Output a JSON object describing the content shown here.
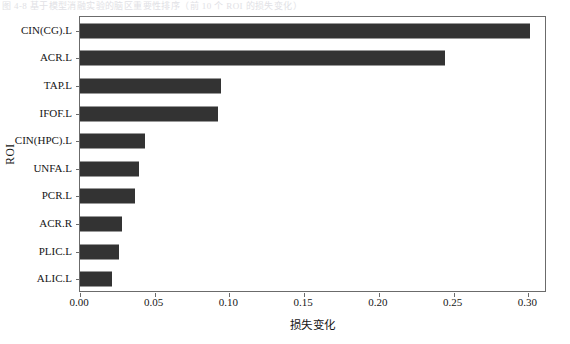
{
  "top_strip": {
    "text": "图 4-8 基于模型消融实验的脑区重要性排序（前 10 个 ROI 的损失变化）"
  },
  "chart_data": {
    "type": "bar",
    "orientation": "horizontal",
    "title": "",
    "xlabel": "损失变化",
    "ylabel": "ROI",
    "categories": [
      "CIN(CG).L",
      "ACR.L",
      "TAP.L",
      "IFOF.L",
      "CIN(HPC).L",
      "UNFA.L",
      "PCR.L",
      "ACR.R",
      "PLIC.L",
      "ALIC.L"
    ],
    "values": [
      0.301,
      0.244,
      0.0945,
      0.0925,
      0.0435,
      0.0395,
      0.0369,
      0.0281,
      0.0261,
      0.0214
    ],
    "xlim": [
      0.0,
      0.3125
    ],
    "ylim_categories": 10,
    "xticks": [
      0.0,
      0.05,
      0.1,
      0.15,
      0.2,
      0.25,
      0.3
    ],
    "xtick_labels": [
      "0.00",
      "0.05",
      "0.10",
      "0.15",
      "0.20",
      "0.25",
      "0.30"
    ],
    "grid": false,
    "legend": null,
    "bar_color": "#333333",
    "frame_color": "#6b6b6b",
    "background": "#ffffff"
  }
}
